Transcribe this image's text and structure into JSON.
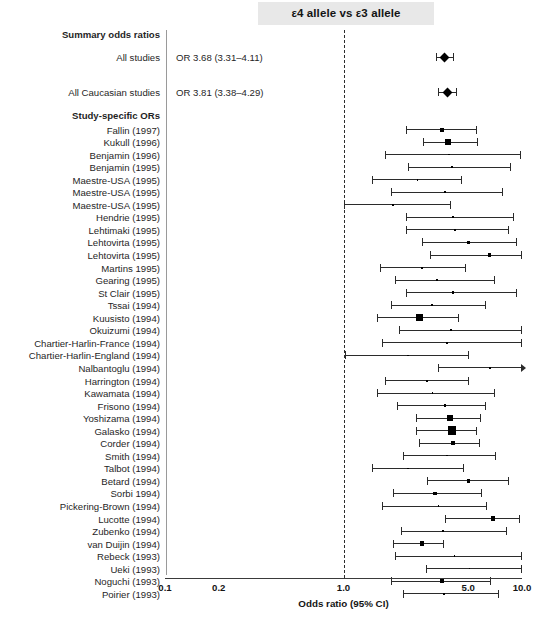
{
  "figure": {
    "title": "ε4 allele vs ε3 allele",
    "axis_title": "Odds ratio (95% CI)",
    "section_headers": {
      "summary": "Summary odds ratios",
      "study_specific": "Study-specific ORs"
    }
  },
  "chart_data": {
    "type": "forest",
    "title": "ε4 allele vs ε3 allele",
    "xlabel": "Odds ratio (95% CI)",
    "ylabel": "",
    "xscale": "log",
    "xlim": [
      0.1,
      10.0
    ],
    "xticks": [
      0.1,
      0.2,
      1.0,
      5.0,
      10.0
    ],
    "xtick_labels": [
      "0.1",
      "0.2",
      "1.0",
      "5.0",
      "10.0"
    ],
    "null_line": 1.0,
    "grid": false,
    "legend": "none",
    "summary": [
      {
        "label": "All studies",
        "or_text": "OR 3.68 (3.31–4.11)",
        "or": 3.68,
        "low": 3.31,
        "high": 4.11,
        "marker": "diamond",
        "marker_size": 7
      },
      {
        "label": "All Caucasian studies",
        "or_text": "OR 3.81 (3.38–4.29)",
        "or": 3.81,
        "low": 3.38,
        "high": 4.29,
        "marker": "diamond",
        "marker_size": 7
      }
    ],
    "studies": [
      {
        "label": "Fallin (1997)",
        "or": 3.55,
        "low": 2.25,
        "high": 5.55,
        "marker_size": 4.0
      },
      {
        "label": "Kukull (1996)",
        "or": 3.85,
        "low": 2.8,
        "high": 5.6,
        "marker_size": 5.5
      },
      {
        "label": "Benjamin (1996)",
        "or": 3.9,
        "low": 1.7,
        "high": 9.8,
        "marker_size": 1.6
      },
      {
        "label": "Benjamin (1995)",
        "or": 4.05,
        "low": 2.3,
        "high": 8.6,
        "marker_size": 1.8
      },
      {
        "label": "Maestre-USA (1995)",
        "or": 2.6,
        "low": 1.45,
        "high": 4.55,
        "marker_size": 1.8
      },
      {
        "label": "Maestre-USA (1995)",
        "or": 3.7,
        "low": 1.85,
        "high": 7.7,
        "marker_size": 2.2
      },
      {
        "label": "Maestre-USA (1995)",
        "or": 1.9,
        "low": 1.0,
        "high": 3.95,
        "marker_size": 1.8
      },
      {
        "label": "Hendrie (1995)",
        "or": 4.1,
        "low": 2.25,
        "high": 8.9,
        "marker_size": 1.8
      },
      {
        "label": "Lehtimaki (1995)",
        "or": 4.2,
        "low": 2.25,
        "high": 8.3,
        "marker_size": 1.8
      },
      {
        "label": "Lehtovirta (1995)",
        "or": 5.0,
        "low": 2.75,
        "high": 9.2,
        "marker_size": 3.4
      },
      {
        "label": "Lehtovirta (1995)",
        "or": 6.6,
        "low": 3.05,
        "high": 9.9,
        "marker_size": 3.4
      },
      {
        "label": "Martins 1995)",
        "or": 2.75,
        "low": 1.6,
        "high": 4.8,
        "marker_size": 2.0
      },
      {
        "label": "Gearing (1995)",
        "or": 3.35,
        "low": 1.95,
        "high": 7.0,
        "marker_size": 1.6
      },
      {
        "label": "St Clair (1995)",
        "or": 4.1,
        "low": 2.25,
        "high": 9.2,
        "marker_size": 2.6
      },
      {
        "label": "Tssai (1994)",
        "or": 3.15,
        "low": 1.85,
        "high": 6.2,
        "marker_size": 2.0
      },
      {
        "label": "Kuusisto (1994)",
        "or": 2.65,
        "low": 1.55,
        "high": 4.4,
        "marker_size": 7.0
      },
      {
        "label": "Okuizumi (1994)",
        "or": 4.0,
        "low": 2.05,
        "high": 9.9,
        "marker_size": 1.6
      },
      {
        "label": "Chartier-Harlin-France (1994)",
        "or": 3.8,
        "low": 1.65,
        "high": 9.9,
        "marker_size": 1.6
      },
      {
        "label": "Chartier-Harlin-England (1994)",
        "or": 2.3,
        "low": 1.02,
        "high": 5.0,
        "marker_size": 1.6
      },
      {
        "label": "Nalbantoglu (1994)",
        "or": 6.6,
        "low": 3.4,
        "high": 9.95,
        "marker_size": 1.6
      },
      {
        "label": "Harrington (1994)",
        "or": 2.95,
        "low": 1.7,
        "high": 5.0,
        "marker_size": 2.0
      },
      {
        "label": "Kawamata (1994)",
        "or": 3.15,
        "low": 1.55,
        "high": 6.95,
        "marker_size": 1.8
      },
      {
        "label": "Frisono (1994)",
        "or": 3.7,
        "low": 2.0,
        "high": 6.2,
        "marker_size": 2.4
      },
      {
        "label": "Yoshizama (1994)",
        "or": 3.95,
        "low": 2.55,
        "high": 5.8,
        "marker_size": 5.5
      },
      {
        "label": "Galasko (1994)",
        "or": 4.05,
        "low": 2.55,
        "high": 5.5,
        "marker_size": 8.5
      },
      {
        "label": "Corder (1994)",
        "or": 4.1,
        "low": 2.65,
        "high": 5.75,
        "marker_size": 4.0
      },
      {
        "label": "Smith (1994)",
        "or": 3.8,
        "low": 2.15,
        "high": 7.1,
        "marker_size": 1.4
      },
      {
        "label": "Talbot (1994)",
        "or": 2.3,
        "low": 1.45,
        "high": 4.65,
        "marker_size": 1.6
      },
      {
        "label": "Betard (1994)",
        "or": 5.0,
        "low": 2.95,
        "high": 8.4,
        "marker_size": 3.4
      },
      {
        "label": "Sorbi 1994)",
        "or": 3.25,
        "low": 1.9,
        "high": 5.9,
        "marker_size": 3.4
      },
      {
        "label": "Pickering-Brown (1994)",
        "or": 3.4,
        "low": 1.65,
        "high": 6.3,
        "marker_size": 1.4
      },
      {
        "label": "Lucotte (1994)",
        "or": 6.9,
        "low": 3.7,
        "high": 9.6,
        "marker_size": 4.2
      },
      {
        "label": "Zubenko (1994)",
        "or": 3.6,
        "low": 2.1,
        "high": 8.1,
        "marker_size": 1.6
      },
      {
        "label": "van Duijin (1994)",
        "or": 2.75,
        "low": 1.9,
        "high": 3.6,
        "marker_size": 4.4
      },
      {
        "label": "Rebeck (1993)",
        "or": 4.2,
        "low": 1.95,
        "high": 9.9,
        "marker_size": 1.4
      },
      {
        "label": "Ueki (1993)",
        "or": 5.1,
        "low": 2.9,
        "high": 9.9,
        "marker_size": 1.4
      },
      {
        "label": "Noguchi (1993)",
        "or": 3.55,
        "low": 1.85,
        "high": 6.6,
        "marker_size": 4.4
      },
      {
        "label": "Poirier (1993)",
        "or": 3.65,
        "low": 2.15,
        "high": 7.3,
        "marker_size": 1.6
      }
    ]
  }
}
